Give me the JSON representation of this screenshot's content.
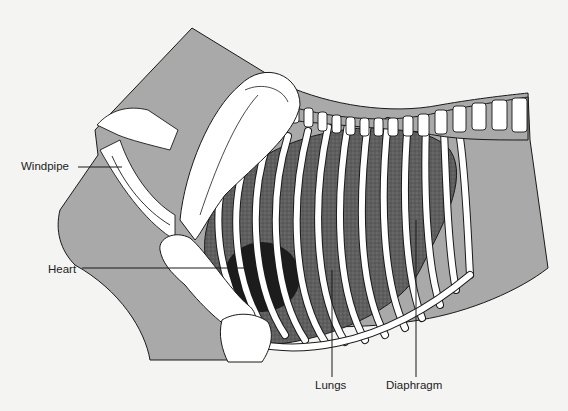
{
  "diagram": {
    "colors": {
      "background": "#f4f4f2",
      "body_fill": "#a9a9a9",
      "bone_fill": "#ffffff",
      "lung_fill": "#5e5e5e",
      "heart_fill": "#1c1c1c",
      "outline": "#1a1a1a"
    },
    "labels": [
      {
        "id": "windpipe",
        "text": "Windpipe"
      },
      {
        "id": "heart",
        "text": "Heart"
      },
      {
        "id": "lungs",
        "text": "Lungs"
      },
      {
        "id": "diaphragm",
        "text": "Diaphragm"
      }
    ]
  }
}
